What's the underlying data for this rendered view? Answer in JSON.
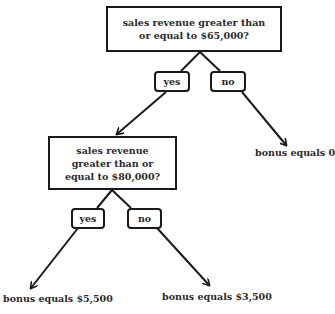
{
  "diagram": {
    "type": "decision-tree",
    "nodes": {
      "q1": {
        "label": "sales revenue greater than or equal to $65,000?"
      },
      "q1_yes": {
        "label": "yes"
      },
      "q1_no": {
        "label": "no"
      },
      "leaf_zero": {
        "label": "bonus equals 0"
      },
      "q2": {
        "label": "sales revenue greater than or equal to $80,000?"
      },
      "q2_yes": {
        "label": "yes"
      },
      "q2_no": {
        "label": "no"
      },
      "leaf_5500": {
        "label": "bonus equals $5,500"
      },
      "leaf_3500": {
        "label": "bonus equals $3,500"
      }
    },
    "edges": [
      {
        "from": "q1",
        "to": "q1_yes"
      },
      {
        "from": "q1",
        "to": "q1_no"
      },
      {
        "from": "q1_yes",
        "to": "q2",
        "arrow": true
      },
      {
        "from": "q1_no",
        "to": "leaf_zero",
        "arrow": true
      },
      {
        "from": "q2",
        "to": "q2_yes"
      },
      {
        "from": "q2",
        "to": "q2_no"
      },
      {
        "from": "q2_yes",
        "to": "leaf_5500",
        "arrow": true
      },
      {
        "from": "q2_no",
        "to": "leaf_3500",
        "arrow": true
      }
    ],
    "colors": {
      "stroke": "#1a1a1a",
      "text": "#2a2a2a",
      "background": "#ffffff"
    }
  }
}
